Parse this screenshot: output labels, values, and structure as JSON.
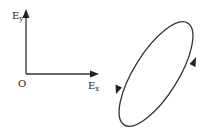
{
  "diagram": {
    "type": "polarization-ellipse",
    "axes": {
      "origin_label": "O",
      "x_label": {
        "main": "E",
        "sub": "x"
      },
      "y_label": {
        "main": "E",
        "sub": "y"
      }
    },
    "ellipse": {
      "orientation": "tilted, major axis from lower-left to upper-right",
      "rotation_direction": "counterclockwise",
      "arrows": [
        {
          "position": "right side",
          "direction": "upward"
        },
        {
          "position": "left side",
          "direction": "downward"
        }
      ]
    },
    "colors": {
      "stroke": "#333333",
      "background": "#ffffff"
    }
  }
}
